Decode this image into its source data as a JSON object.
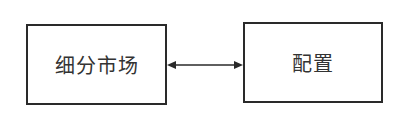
{
  "diagram": {
    "nodes": [
      {
        "id": "left",
        "label": "细分市场"
      },
      {
        "id": "right",
        "label": "配置"
      }
    ],
    "edges": [
      {
        "from": "left",
        "to": "right",
        "direction": "bidirectional"
      }
    ],
    "colors": {
      "stroke": "#2a2a2a",
      "text": "#333333",
      "background": "#ffffff"
    }
  }
}
